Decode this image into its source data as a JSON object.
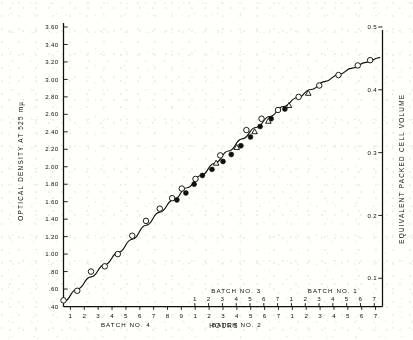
{
  "chart_data": {
    "type": "scatter",
    "title": "",
    "subtitle": "",
    "ylabel": "OPTICAL  DENSITY  AT  525  mµ",
    "ylabel_right": "EQUIVALENT  PACKED  CELL  VOLUME",
    "xlabel": "HOURS",
    "ylim": [
      0.4,
      3.6
    ],
    "ylim_right": [
      0.055,
      0.5
    ],
    "yticks": [
      "3.60",
      "3.40",
      "3.20",
      "3.00",
      "2.80",
      "2.60",
      "2.40",
      "2.20",
      "2.00",
      "1.80",
      "1.60",
      "1.40",
      "1.20",
      "1.00",
      ".80",
      ".60",
      ".40"
    ],
    "ytick_values": [
      3.6,
      3.4,
      3.2,
      3.0,
      2.8,
      2.6,
      2.4,
      2.2,
      2.0,
      1.8,
      1.6,
      1.4,
      1.2,
      1.0,
      0.8,
      0.6,
      0.4
    ],
    "yticks_right": [
      "0.5",
      "0.4",
      "0.3",
      "0.2",
      "0.1"
    ],
    "ytick_right_values": [
      0.5,
      0.4,
      0.3,
      0.2,
      0.1
    ],
    "grid": false,
    "legend": "none",
    "axis_note": "dual staggered x-axis rows; lower row and upper row each carry batch-hour numbering",
    "xaxis_lower": {
      "ticks": [
        1,
        2,
        3,
        4,
        5,
        6,
        7,
        8,
        9,
        1,
        2,
        3,
        4,
        5,
        6,
        7,
        1,
        2,
        3,
        4,
        5,
        6,
        7
      ],
      "label_runs": [
        {
          "text": "BATCH  NO.  4",
          "start_index": 0,
          "end_index": 8
        },
        {
          "text": "BATCH  NO.  2",
          "start_index": 9,
          "end_index": 15
        }
      ]
    },
    "xaxis_upper": {
      "ticks": [
        1,
        2,
        3,
        4,
        5,
        6,
        7,
        1,
        2,
        3,
        4,
        5,
        6,
        7
      ],
      "label_runs": [
        {
          "text": "BATCH  NO.  3",
          "start_index": 0,
          "end_index": 6
        },
        {
          "text": "BATCH  NO.  1",
          "start_index": 7,
          "end_index": 13
        }
      ]
    },
    "series": [
      {
        "name": "open-circle",
        "marker": "open circle",
        "points": [
          [
            0.0,
            0.47
          ],
          [
            1.0,
            0.58
          ],
          [
            2.0,
            0.8
          ],
          [
            3.0,
            0.86
          ],
          [
            3.95,
            1.0
          ],
          [
            5.0,
            1.21
          ],
          [
            6.0,
            1.38
          ],
          [
            7.0,
            1.52
          ],
          [
            7.9,
            1.64
          ],
          [
            8.6,
            1.75
          ],
          [
            9.6,
            1.86
          ],
          [
            11.4,
            2.13
          ],
          [
            13.3,
            2.42
          ],
          [
            14.4,
            2.55
          ],
          [
            15.6,
            2.65
          ],
          [
            17.1,
            2.8
          ],
          [
            18.6,
            2.93
          ],
          [
            20.0,
            3.05
          ],
          [
            21.4,
            3.16
          ],
          [
            22.3,
            3.22
          ]
        ]
      },
      {
        "name": "filled-circle",
        "marker": "filled circle",
        "points": [
          [
            8.25,
            1.62
          ],
          [
            8.9,
            1.7
          ],
          [
            9.5,
            1.8
          ],
          [
            10.1,
            1.9
          ],
          [
            10.8,
            1.97
          ],
          [
            11.6,
            2.06
          ],
          [
            12.2,
            2.14
          ],
          [
            12.9,
            2.24
          ],
          [
            13.6,
            2.34
          ],
          [
            14.3,
            2.46
          ],
          [
            15.1,
            2.55
          ],
          [
            16.1,
            2.66
          ]
        ]
      },
      {
        "name": "triangle",
        "marker": "open triangle",
        "points": [
          [
            11.1,
            2.04
          ],
          [
            12.6,
            2.22
          ],
          [
            13.9,
            2.4
          ],
          [
            14.9,
            2.52
          ],
          [
            16.4,
            2.7
          ],
          [
            17.8,
            2.84
          ]
        ]
      }
    ]
  },
  "axes": {
    "y_left_label": "OPTICAL  DENSITY  AT  525  mµ",
    "y_right_label": "EQUIVALENT  PACKED  CELL  VOLUME",
    "x_label": "HOURS"
  }
}
